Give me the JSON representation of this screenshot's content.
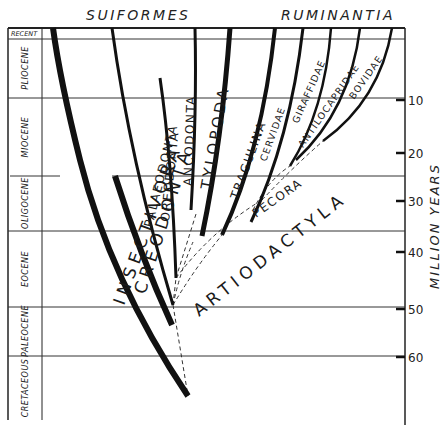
{
  "titles": {
    "left": "SUIFORMES",
    "right": "RUMINANTIA"
  },
  "periods": [
    {
      "label": "RECENT"
    },
    {
      "label": "PLIOCENE"
    },
    {
      "label": "MIOCENE"
    },
    {
      "label": "OLIGOCENE"
    },
    {
      "label": "EOCENE"
    },
    {
      "label": "PALEOCENE"
    },
    {
      "label": "CRETACEOUS"
    }
  ],
  "axis": {
    "label": "MILLION YEARS",
    "ticks": [
      "10",
      "20",
      "30",
      "40",
      "50",
      "60"
    ]
  },
  "taxa": {
    "insectivora": "INSECTIVORA",
    "creodonta": "CREODONTA",
    "palaeodonta": "PALAEODONTA",
    "oreodonta": "OREODONTA",
    "ancodonta": "ANCODONTA",
    "tylopoda": "TYLOPODA",
    "tragulina": "TRAGULINA",
    "cervidae": "CERVIDAE",
    "giraffidae": "GIRAFFIDAE",
    "antilocapridae": "ANTILOCAPRIDAE",
    "bovidae": "BOVIDAE",
    "pecora": "PECORA",
    "artiodactyla": "ARTIODACTYLA"
  },
  "colors": {
    "ink": "#111111",
    "paper": "#ffffff"
  }
}
